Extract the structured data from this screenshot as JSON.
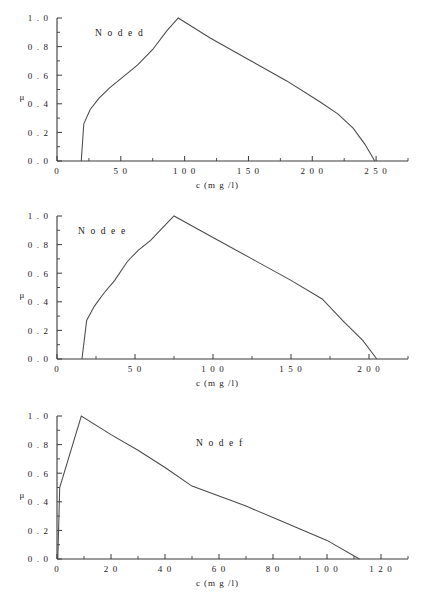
{
  "page": {
    "background_color": "#ffffff",
    "line_color": "#4a4a4a",
    "text_color": "#1a1a1a"
  },
  "chart_data": [
    {
      "type": "line",
      "title": "N o d e   d",
      "xlabel": "c   (m g /l)",
      "ylabel": "μ",
      "xlim": [
        0,
        275
      ],
      "ylim": [
        0.0,
        1.0
      ],
      "grid": false,
      "legend": "none",
      "xticks": [
        0,
        50,
        100,
        150,
        200,
        250
      ],
      "xtick_labels": [
        "0",
        "5 0",
        "1 0 0",
        "1 5 0",
        "2 0 0",
        "2 5 0"
      ],
      "xminor_step": 25,
      "yticks": [
        0.0,
        0.2,
        0.4,
        0.6,
        0.8,
        1.0
      ],
      "ytick_labels": [
        "0 . 0",
        "0 . 2",
        "0 . 4",
        "0 . 6",
        "0 . 8",
        "1 . 0"
      ],
      "yminor_step": 0.1,
      "x": [
        19,
        21,
        26,
        33,
        41,
        52,
        63,
        75,
        86,
        95,
        120,
        150,
        180,
        205,
        220,
        232,
        241,
        249
      ],
      "y": [
        0.0,
        0.26,
        0.36,
        0.44,
        0.51,
        0.59,
        0.67,
        0.78,
        0.91,
        1.0,
        0.86,
        0.71,
        0.56,
        0.42,
        0.33,
        0.23,
        0.12,
        0.0
      ]
    },
    {
      "type": "line",
      "title": "N o d e   e",
      "xlabel": "c   (m g /l)",
      "ylabel": "μ",
      "xlim": [
        0,
        225
      ],
      "ylim": [
        0.0,
        1.0
      ],
      "grid": false,
      "legend": "none",
      "xticks": [
        0,
        50,
        100,
        150,
        200
      ],
      "xtick_labels": [
        "0",
        "5 0",
        "1 0 0",
        "1 5 0",
        "2 0 0"
      ],
      "xminor_step": 25,
      "yticks": [
        0.0,
        0.2,
        0.4,
        0.6,
        0.8,
        1.0
      ],
      "ytick_labels": [
        "0 . 0",
        "0 . 2",
        "0 . 4",
        "0 . 6",
        "0 . 8",
        "1 . 0"
      ],
      "yminor_step": 0.1,
      "x": [
        16,
        19,
        24,
        30,
        37,
        45,
        52,
        60,
        67,
        75,
        100,
        125,
        150,
        170,
        183,
        196,
        205
      ],
      "y": [
        0.0,
        0.27,
        0.37,
        0.46,
        0.55,
        0.68,
        0.76,
        0.83,
        0.91,
        1.0,
        0.85,
        0.7,
        0.55,
        0.42,
        0.27,
        0.13,
        0.0
      ]
    },
    {
      "type": "line",
      "title": "N o d e   f",
      "xlabel": "c   (m g /l)",
      "ylabel": "μ",
      "xlim": [
        0,
        130
      ],
      "ylim": [
        0.0,
        1.0
      ],
      "grid": false,
      "legend": "none",
      "xticks": [
        0,
        20,
        40,
        60,
        80,
        100,
        120
      ],
      "xtick_labels": [
        "0",
        "2 0",
        "4 0",
        "6 0",
        "8 0",
        "1 0 0",
        "1 2 0"
      ],
      "xminor_step": 10,
      "yticks": [
        0.0,
        0.2,
        0.4,
        0.6,
        0.8,
        1.0
      ],
      "ytick_labels": [
        "0 . 0",
        "0 . 2",
        "0 . 4",
        "0 . 6",
        "0 . 8",
        "1 . 0"
      ],
      "yminor_step": 0.1,
      "x": [
        0.3,
        1.0,
        9.0,
        20,
        30,
        40,
        50,
        60,
        70,
        80,
        90,
        100,
        112
      ],
      "y": [
        0.0,
        0.5,
        1.0,
        0.87,
        0.76,
        0.64,
        0.51,
        0.44,
        0.37,
        0.29,
        0.21,
        0.13,
        0.0
      ]
    }
  ]
}
